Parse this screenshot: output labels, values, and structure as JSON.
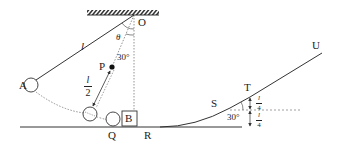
{
  "diagram": {
    "colors": {
      "line": "#333333",
      "dotted": "#777777",
      "background": "#ffffff"
    },
    "labels": {
      "pivot": "O",
      "ball_start": "A",
      "peg": "P",
      "ball_bottom": "Q",
      "block": "B",
      "point_r": "R",
      "point_s": "S",
      "point_t": "T",
      "point_u": "U",
      "string_length": "l",
      "angle_theta": "θ",
      "angle_30_top": "30°",
      "angle_30_ramp": "30°"
    },
    "fractions": {
      "peg_distance": {
        "num": "l",
        "den": "2"
      },
      "height_upper": {
        "num": "l",
        "den": "4"
      },
      "height_lower": {
        "num": "l",
        "den": "4"
      }
    }
  }
}
